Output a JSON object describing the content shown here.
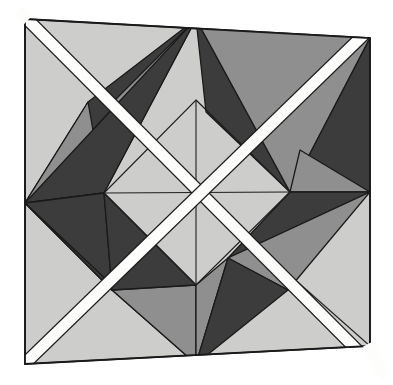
{
  "artwork": {
    "title": "Abstract geometric tessellation",
    "description": "Skewed square panel on white ground, filled with a light gray field, containing four eight-point star motifs built from dark gray and mid gray triangles around a central light diamond, overlaid by two white diagonal bands crossing in an X.",
    "canvas": {
      "width": 393,
      "height": 385
    },
    "palette": {
      "background": "#ffffff",
      "panel_fill": "#cdcdcb",
      "panel_fill_alt": "#c9c9c7",
      "mid_gray": "#8f8f8f",
      "mid_gray_alt": "#9a9a9a",
      "dark_gray": "#3c3c3c",
      "dark_gray_alt": "#444444",
      "band_white": "#fdfdfb",
      "outline": "#1a1a1a",
      "outline_soft": "#2b2b2b"
    },
    "geometry": {
      "panel_corners": {
        "top_left": [
          25,
          19
        ],
        "top_right": [
          370,
          38
        ],
        "bottom_right": [
          370,
          346
        ],
        "bottom_left": [
          25,
          364
        ]
      },
      "midpoints": {
        "top": [
          196,
          19
        ],
        "right": [
          370,
          192
        ],
        "bottom": [
          196,
          364
        ],
        "left": [
          25,
          203
        ]
      },
      "center": [
        197,
        193
      ],
      "inner_diamond": {
        "top": [
          196,
          100
        ],
        "right": [
          290,
          192
        ],
        "bottom": [
          196,
          285
        ],
        "left": [
          104,
          193
        ]
      },
      "band_stroke_width": 11,
      "outline_stroke_width": 1.4
    },
    "shape_counts": {
      "dark_triangles": 8,
      "mid_triangles": 8,
      "white_bands": 2,
      "star_motifs": 4
    }
  }
}
